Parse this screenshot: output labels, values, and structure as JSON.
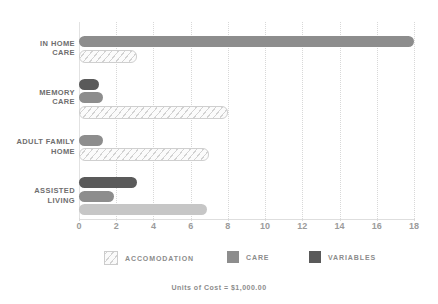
{
  "chart_data": {
    "type": "bar",
    "orientation": "horizontal",
    "title": "COST OF CARE",
    "categories": [
      "IN HOME CARE",
      "MEMORY CARE",
      "ADULT FAMILY HOME",
      "ASSISTED LIVING"
    ],
    "series": [
      {
        "name": "ACCOMODATION",
        "color": "#d2d2d2",
        "values": [
          3.0,
          7.9,
          6.9,
          6.9
        ]
      },
      {
        "name": "CARE",
        "color": "#8d8d8d",
        "values": [
          18.0,
          1.3,
          1.3,
          1.9
        ]
      },
      {
        "name": "VARIABLES",
        "color": "#5a5a5a",
        "values": [
          0,
          1.1,
          0,
          3.1
        ]
      }
    ],
    "xlabel": "",
    "ylabel": "",
    "xlim": [
      0,
      18
    ],
    "xticks": [
      0,
      2,
      4,
      6,
      8,
      10,
      12,
      14,
      16,
      18
    ],
    "xtick_labels": [
      "0",
      "2",
      "4",
      "6",
      "8",
      "10",
      "12",
      "14",
      "16",
      "18"
    ],
    "grid": true,
    "grid_axis": "x",
    "legend_position": "bottom",
    "footnote": "Units of Cost = $1,000.00"
  },
  "legend": {
    "items": [
      {
        "label": "ACCOMODATION"
      },
      {
        "label": "CARE"
      },
      {
        "label": "VARIABLES"
      }
    ]
  },
  "footer": {
    "units_note": "Units of Cost = $1,000.00"
  }
}
